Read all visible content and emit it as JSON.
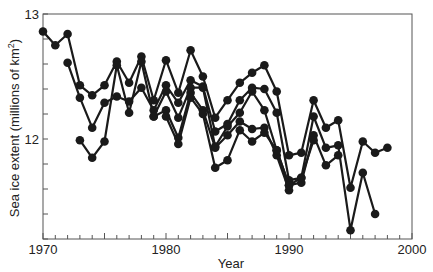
{
  "chart_data": {
    "type": "line",
    "title": "",
    "xlabel": "Year",
    "ylabel": "Sea ice extent (millions of km²)",
    "ylabel_main": "Sea ice extent (millions of km",
    "ylabel_sup": "2",
    "ylabel_end": ")",
    "xlim": [
      1970,
      2000
    ],
    "ylim": [
      11.2,
      13.0
    ],
    "x_tick_labels": [
      "1970",
      "1980",
      "1990",
      "2000"
    ],
    "x_ticks": [
      1970,
      1980,
      1990,
      2000
    ],
    "x_minor_step": 1,
    "y_tick_labels": [
      "12",
      "13"
    ],
    "y_ticks": [
      12,
      13
    ],
    "y_minor_step": 0.2,
    "grid": false,
    "legend": null,
    "marker": "filled-circle",
    "line_color": "#1a1a1a",
    "series": [
      {
        "name": "Series 1",
        "points": [
          [
            1970,
            12.86
          ],
          [
            1971,
            12.75
          ],
          [
            1972,
            12.84
          ],
          [
            1973,
            12.43
          ],
          [
            1974,
            12.35
          ],
          [
            1975,
            12.43
          ],
          [
            1976,
            12.62
          ],
          [
            1977,
            12.45
          ],
          [
            1978,
            12.66
          ],
          [
            1979,
            12.31
          ],
          [
            1980,
            12.63
          ],
          [
            1981,
            12.37
          ],
          [
            1982,
            12.71
          ],
          [
            1983,
            12.5
          ],
          [
            1984,
            12.17
          ],
          [
            1985,
            12.31
          ],
          [
            1986,
            12.45
          ],
          [
            1987,
            12.53
          ],
          [
            1988,
            12.59
          ],
          [
            1989,
            12.38
          ],
          [
            1990,
            11.87
          ],
          [
            1991,
            11.89
          ],
          [
            1992,
            12.31
          ],
          [
            1993,
            12.09
          ],
          [
            1994,
            12.15
          ],
          [
            1995,
            11.61
          ],
          [
            1996,
            11.98
          ],
          [
            1997,
            11.89
          ],
          [
            1998,
            11.93
          ]
        ]
      },
      {
        "name": "Series 2",
        "points": [
          [
            1972,
            12.61
          ],
          [
            1973,
            12.33
          ],
          [
            1974,
            12.09
          ],
          [
            1975,
            12.29
          ],
          [
            1976,
            12.34
          ],
          [
            1977,
            12.3
          ],
          [
            1978,
            12.41
          ],
          [
            1979,
            12.23
          ],
          [
            1980,
            12.43
          ],
          [
            1981,
            12.29
          ],
          [
            1982,
            12.47
          ],
          [
            1983,
            12.42
          ],
          [
            1984,
            12.06
          ],
          [
            1985,
            12.12
          ],
          [
            1986,
            12.31
          ],
          [
            1987,
            12.41
          ],
          [
            1988,
            12.4
          ],
          [
            1989,
            12.21
          ],
          [
            1990,
            11.67
          ],
          [
            1991,
            11.69
          ],
          [
            1992,
            12.18
          ],
          [
            1993,
            11.93
          ],
          [
            1994,
            11.95
          ],
          [
            1995,
            11.27
          ],
          [
            1996,
            11.73
          ],
          [
            1997,
            11.4
          ]
        ]
      },
      {
        "name": "Series 3",
        "points": [
          [
            1973,
            11.99
          ],
          [
            1974,
            11.85
          ],
          [
            1975,
            11.98
          ],
          [
            1976,
            12.59
          ],
          [
            1977,
            12.21
          ],
          [
            1978,
            12.62
          ],
          [
            1979,
            12.18
          ],
          [
            1980,
            12.38
          ],
          [
            1981,
            12.17
          ],
          [
            1982,
            12.41
          ],
          [
            1983,
            12.41
          ],
          [
            1984,
            11.94
          ],
          [
            1985,
            12.1
          ],
          [
            1986,
            12.21
          ],
          [
            1987,
            12.38
          ],
          [
            1988,
            12.23
          ],
          [
            1989,
            11.91
          ],
          [
            1990,
            11.63
          ],
          [
            1991,
            11.65
          ],
          [
            1992,
            12.03
          ],
          [
            1993,
            11.79
          ],
          [
            1994,
            11.87
          ]
        ]
      },
      {
        "name": "Series 4",
        "points": [
          [
            1979,
            12.18
          ],
          [
            1980,
            12.23
          ],
          [
            1981,
            12.01
          ],
          [
            1982,
            12.37
          ],
          [
            1983,
            12.23
          ],
          [
            1984,
            11.93
          ],
          [
            1985,
            12.03
          ],
          [
            1986,
            12.14
          ],
          [
            1987,
            12.08
          ],
          [
            1988,
            12.09
          ],
          [
            1989,
            11.87
          ],
          [
            1990,
            11.59
          ]
        ]
      },
      {
        "name": "Series 5",
        "points": [
          [
            1980,
            12.18
          ],
          [
            1981,
            11.96
          ],
          [
            1982,
            12.33
          ],
          [
            1983,
            12.2
          ],
          [
            1984,
            11.77
          ],
          [
            1985,
            11.83
          ],
          [
            1986,
            12.07
          ],
          [
            1987,
            11.98
          ],
          [
            1988,
            12.05
          ],
          [
            1989,
            11.91
          ],
          [
            1990,
            11.63
          ],
          [
            1991,
            11.69
          ],
          [
            1992,
            11.99
          ]
        ]
      }
    ]
  }
}
